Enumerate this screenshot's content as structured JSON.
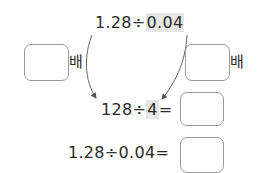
{
  "top_expression": {
    "left": "1.28",
    "op": "÷",
    "right": "0.04"
  },
  "left_factor": {
    "value": "",
    "unit": "배"
  },
  "right_factor": {
    "value": "",
    "unit": "배"
  },
  "middle_expression": {
    "left": "128",
    "op": "÷",
    "right": "4",
    "eq": "=",
    "answer": ""
  },
  "bottom_expression": {
    "left": "1.28",
    "op": "÷",
    "right": "0.04",
    "eq": "=",
    "answer": ""
  }
}
